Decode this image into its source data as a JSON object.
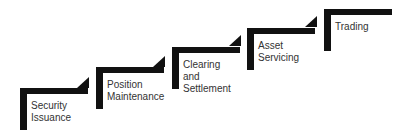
{
  "diagram": {
    "type": "staircase",
    "color": "#111111",
    "steps": [
      {
        "label": "Security\nIssuance"
      },
      {
        "label": "Position\nMaintenance"
      },
      {
        "label": "Clearing and\nSettlement"
      },
      {
        "label": "Asset\nServicing"
      },
      {
        "label": "Trading"
      }
    ]
  }
}
